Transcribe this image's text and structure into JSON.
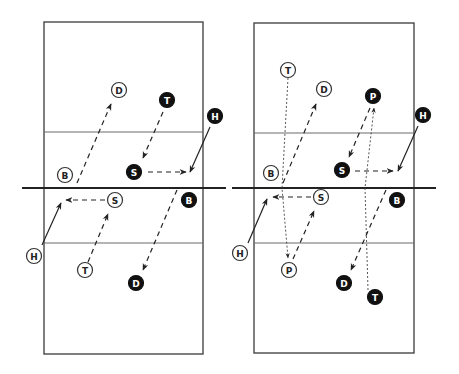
{
  "diagrams": [
    {
      "name": "left-court",
      "players": [
        {
          "label": "D",
          "team": "open",
          "x": 119,
          "y": 90
        },
        {
          "label": "T",
          "team": "filled",
          "x": 167,
          "y": 100
        },
        {
          "label": "H",
          "team": "filled",
          "x": 215,
          "y": 116
        },
        {
          "label": "B",
          "team": "open",
          "x": 65,
          "y": 175
        },
        {
          "label": "S",
          "team": "filled",
          "x": 134,
          "y": 172
        },
        {
          "label": "S",
          "team": "open",
          "x": 115,
          "y": 200
        },
        {
          "label": "B",
          "team": "filled",
          "x": 189,
          "y": 200
        },
        {
          "label": "H",
          "team": "open",
          "x": 34,
          "y": 256
        },
        {
          "label": "T",
          "team": "open",
          "x": 85,
          "y": 270
        },
        {
          "label": "D",
          "team": "filled",
          "x": 136,
          "y": 283
        }
      ]
    },
    {
      "name": "right-court",
      "players": [
        {
          "label": "T",
          "team": "open",
          "x": 288,
          "y": 70
        },
        {
          "label": "D",
          "team": "open",
          "x": 324,
          "y": 89
        },
        {
          "label": "P",
          "team": "filled",
          "x": 373,
          "y": 96
        },
        {
          "label": "H",
          "team": "filled",
          "x": 423,
          "y": 115
        },
        {
          "label": "B",
          "team": "open",
          "x": 271,
          "y": 173
        },
        {
          "label": "S",
          "team": "filled",
          "x": 342,
          "y": 170
        },
        {
          "label": "S",
          "team": "open",
          "x": 321,
          "y": 197
        },
        {
          "label": "B",
          "team": "filled",
          "x": 397,
          "y": 200
        },
        {
          "label": "H",
          "team": "open",
          "x": 240,
          "y": 253
        },
        {
          "label": "P",
          "team": "open",
          "x": 289,
          "y": 270
        },
        {
          "label": "D",
          "team": "filled",
          "x": 344,
          "y": 283
        },
        {
          "label": "T",
          "team": "filled",
          "x": 375,
          "y": 297
        }
      ]
    }
  ],
  "colors": {
    "line": "#222222",
    "court": "#3a3a3a",
    "filled": "#111111",
    "open": "#ffffff"
  }
}
